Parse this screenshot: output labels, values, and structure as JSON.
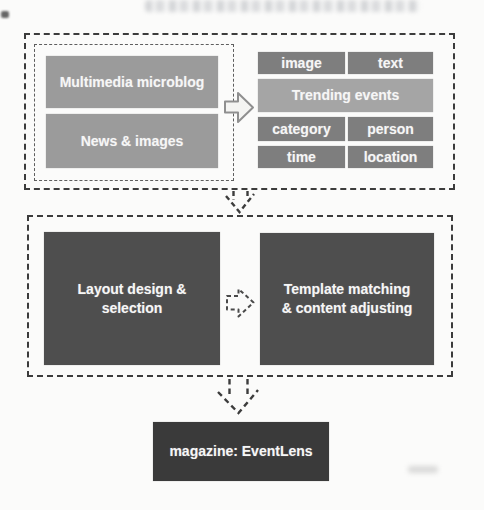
{
  "colors": {
    "paper": "#fbfbfa",
    "dash_dark": "#3c3c3c",
    "dash_inner": "#5e5e5e",
    "source_box": "#9b9b9b",
    "trending_box": "#a5a5a5",
    "attr_box": "#7e7e7e",
    "stage_box": "#4e4e4e",
    "output_box": "#3a3a3a",
    "label_text": "#f6f6f6"
  },
  "icons": {
    "extract_arrow": "block-arrow-right",
    "stage_flow_arrow": "dashed-arrow-down",
    "compose_arrow": "dashed-block-arrow-right",
    "output_arrow": "dashed-arrow-down"
  },
  "stage1": {
    "sources": [
      "Multimedia microblog",
      "News & images"
    ],
    "event": {
      "modalities": [
        "image",
        "text"
      ],
      "title": "Trending events",
      "attributes": [
        "category",
        "person",
        "time",
        "location"
      ]
    }
  },
  "stage2": {
    "steps": [
      {
        "line1": "Layout design &",
        "line2": "selection"
      },
      {
        "line1": "Template matching",
        "line2": "& content adjusting"
      }
    ]
  },
  "output": {
    "label": "magazine: EventLens"
  }
}
